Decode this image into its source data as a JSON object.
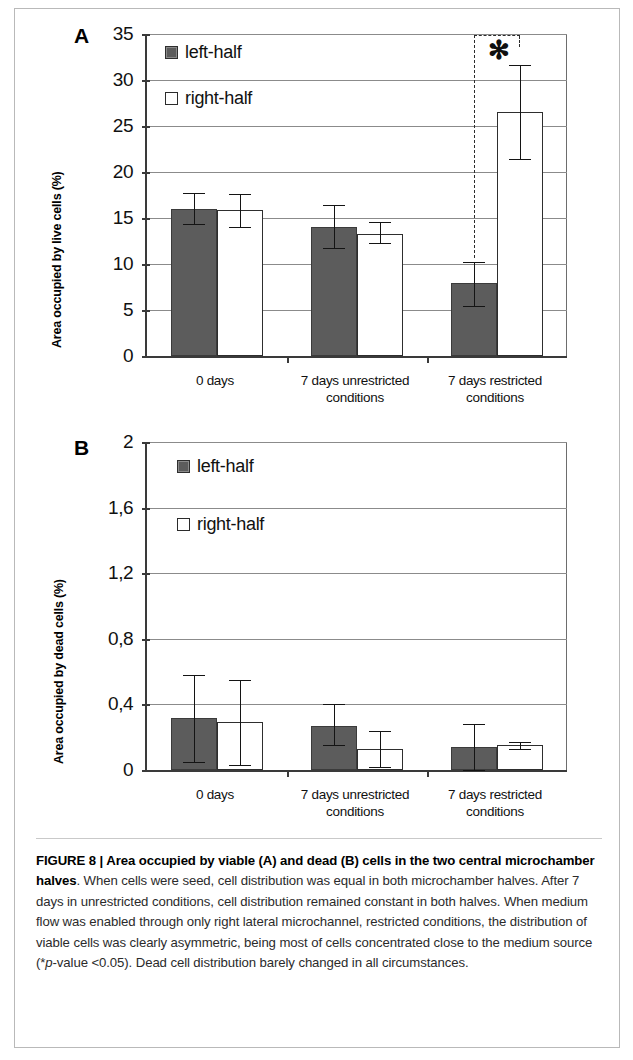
{
  "figure": {
    "panel_a_letter": "A",
    "panel_b_letter": "B",
    "caption_label": "FIGURE 8 | ",
    "caption_bold": "Area occupied by viable (A) and dead (B) cells in the two central microchamber halves",
    "caption_rest_1": ". When cells were seed, cell distribution was equal in both microchamber halves. After 7 days in unrestricted conditions, cell distribution remained constant in both halves. When medium flow was enabled through only right lateral microchannel, restricted conditions, the distribution of viable cells was clearly asymmetric, being most of cells concentrated close to the medium source (*",
    "caption_italic": "p",
    "caption_rest_2": "-value <0.05). Dead cell distribution barely changed in all circumstances.",
    "significance_marker": "✻"
  },
  "colors": {
    "left_half_fill": "#5c5c5c",
    "right_half_fill": "#ffffff",
    "axis": "#3a3a3a",
    "gridline": "#8b8b8b",
    "text": "#111111"
  },
  "chart_data": [
    {
      "type": "bar",
      "panel": "A",
      "title": "Area occupied by viable cells",
      "xlabel": "",
      "ylabel": "Area occupied by live cells (%)",
      "ylim": [
        0,
        35
      ],
      "yticks": [
        0,
        5,
        10,
        15,
        20,
        25,
        30,
        35
      ],
      "ytick_labels": [
        "0",
        "5",
        "10",
        "15",
        "20",
        "25",
        "30",
        "35"
      ],
      "grid": true,
      "legend": [
        "left-half",
        "right-half"
      ],
      "legend_position": "upper-left-inside",
      "categories": [
        "0 days",
        "7 days unrestricted\nconditions",
        "7 days restricted\nconditions"
      ],
      "series": [
        {
          "name": "left-half",
          "values": [
            16.0,
            14.0,
            7.9
          ],
          "err_low": [
            14.3,
            11.7,
            5.4
          ],
          "err_high": [
            17.7,
            16.4,
            10.2
          ]
        },
        {
          "name": "right-half",
          "values": [
            15.9,
            13.3,
            26.5
          ],
          "err_low": [
            14.0,
            12.3,
            21.4
          ],
          "err_high": [
            17.6,
            14.6,
            31.6
          ]
        }
      ],
      "annotations": [
        {
          "text": "✻",
          "meaning": "p-value < 0.05",
          "applies_to_group": "7 days restricted conditions"
        }
      ]
    },
    {
      "type": "bar",
      "panel": "B",
      "title": "Area occupied by dead cells",
      "xlabel": "",
      "ylabel": "Area occupied by dead cells (%)",
      "ylim": [
        0,
        2
      ],
      "yticks": [
        0,
        0.4,
        0.8,
        1.2,
        1.6,
        2
      ],
      "ytick_labels": [
        "0",
        "0,4",
        "0,8",
        "1,2",
        "1,6",
        "2"
      ],
      "grid": true,
      "legend": [
        "left-half",
        "right-half"
      ],
      "legend_position": "upper-left-inside",
      "categories": [
        "0 days",
        "7 days unrestricted\nconditions",
        "7 days restricted\nconditions"
      ],
      "series": [
        {
          "name": "left-half",
          "values": [
            0.32,
            0.27,
            0.14
          ],
          "err_low": [
            0.05,
            0.15,
            0.0
          ],
          "err_high": [
            0.58,
            0.4,
            0.28
          ]
        },
        {
          "name": "right-half",
          "values": [
            0.29,
            0.13,
            0.15
          ],
          "err_low": [
            0.03,
            0.02,
            0.13
          ],
          "err_high": [
            0.55,
            0.24,
            0.17
          ]
        }
      ],
      "annotations": []
    }
  ]
}
